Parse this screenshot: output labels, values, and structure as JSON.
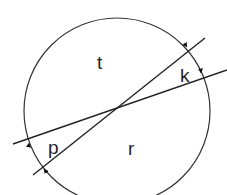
{
  "diagram": {
    "type": "circle-with-intersecting-secants",
    "labels": {
      "t": "t",
      "k": "k",
      "p": "p",
      "r": "r"
    },
    "colors": {
      "stroke": "#222222",
      "background": "#ffffff"
    }
  }
}
